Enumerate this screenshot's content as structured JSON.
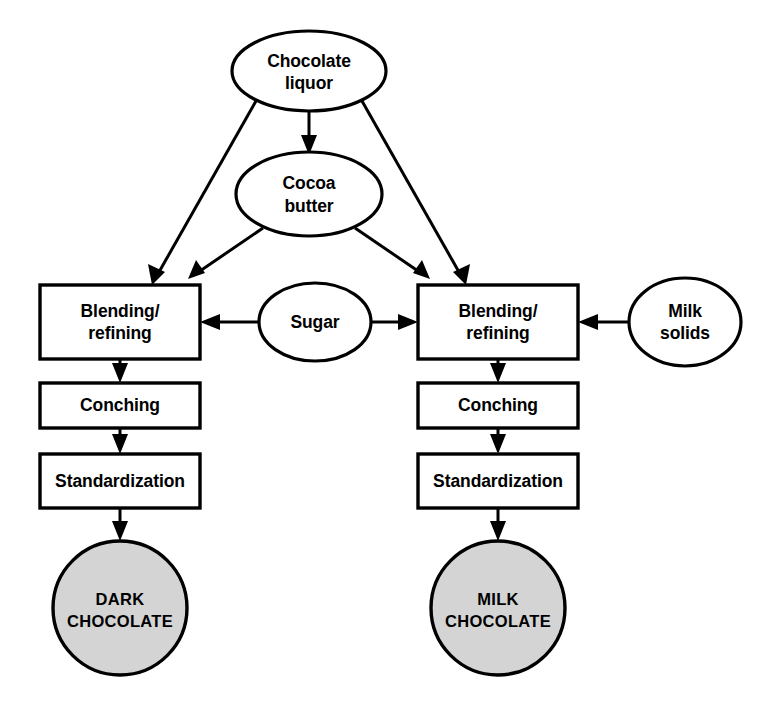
{
  "diagram": {
    "type": "flowchart",
    "background_color": "#ffffff",
    "line_color": "#000000",
    "product_fill_color": "#d4d4d4",
    "node_fill_color": "#ffffff",
    "nodes": [
      {
        "id": "chocolate-liquor",
        "label_line1": "Chocolate",
        "label_line2": "liquor",
        "shape": "ellipse",
        "role": "ingredient"
      },
      {
        "id": "cocoa-butter",
        "label_line1": "Cocoa",
        "label_line2": "butter",
        "shape": "ellipse",
        "role": "ingredient"
      },
      {
        "id": "sugar",
        "label_line1": "Sugar",
        "label_line2": "",
        "shape": "ellipse",
        "role": "ingredient"
      },
      {
        "id": "milk-solids",
        "label_line1": "Milk",
        "label_line2": "solids",
        "shape": "ellipse",
        "role": "ingredient"
      },
      {
        "id": "blending-refining-dark",
        "label_line1": "Blending/",
        "label_line2": "refining",
        "shape": "rectangle",
        "role": "process"
      },
      {
        "id": "conching-dark",
        "label_line1": "Conching",
        "label_line2": "",
        "shape": "rectangle",
        "role": "process"
      },
      {
        "id": "standardization-dark",
        "label_line1": "Standardization",
        "label_line2": "",
        "shape": "rectangle",
        "role": "process"
      },
      {
        "id": "dark-chocolate",
        "label_line1": "DARK",
        "label_line2": "CHOCOLATE",
        "shape": "circle",
        "role": "product"
      },
      {
        "id": "blending-refining-milk",
        "label_line1": "Blending/",
        "label_line2": "refining",
        "shape": "rectangle",
        "role": "process"
      },
      {
        "id": "conching-milk",
        "label_line1": "Conching",
        "label_line2": "",
        "shape": "rectangle",
        "role": "process"
      },
      {
        "id": "standardization-milk",
        "label_line1": "Standardization",
        "label_line2": "",
        "shape": "rectangle",
        "role": "process"
      },
      {
        "id": "milk-chocolate",
        "label_line1": "MILK",
        "label_line2": "CHOCOLATE",
        "shape": "circle",
        "role": "product"
      }
    ],
    "edges": [
      {
        "from": "chocolate-liquor",
        "to": "cocoa-butter"
      },
      {
        "from": "chocolate-liquor",
        "to": "blending-refining-dark"
      },
      {
        "from": "chocolate-liquor",
        "to": "blending-refining-milk"
      },
      {
        "from": "cocoa-butter",
        "to": "blending-refining-dark"
      },
      {
        "from": "cocoa-butter",
        "to": "blending-refining-milk"
      },
      {
        "from": "sugar",
        "to": "blending-refining-dark"
      },
      {
        "from": "sugar",
        "to": "blending-refining-milk"
      },
      {
        "from": "milk-solids",
        "to": "blending-refining-milk"
      },
      {
        "from": "blending-refining-dark",
        "to": "conching-dark"
      },
      {
        "from": "conching-dark",
        "to": "standardization-dark"
      },
      {
        "from": "standardization-dark",
        "to": "dark-chocolate"
      },
      {
        "from": "blending-refining-milk",
        "to": "conching-milk"
      },
      {
        "from": "conching-milk",
        "to": "standardization-milk"
      },
      {
        "from": "standardization-milk",
        "to": "milk-chocolate"
      }
    ]
  }
}
